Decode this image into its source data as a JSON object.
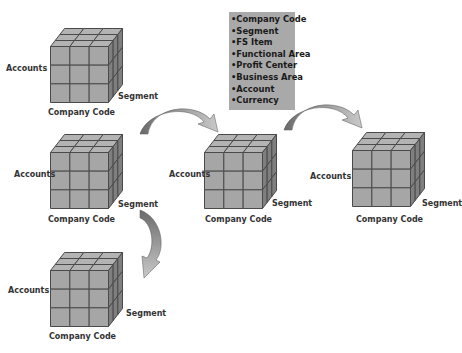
{
  "colors": {
    "face_front": "#a6a6a6",
    "face_top": "#b3b3b3",
    "face_side": "#7f7f7f",
    "edge": "#4a4a4a",
    "info_box_bg": "#a9a9a9",
    "arrow_dark": "#6b6b6b",
    "arrow_light": "#c4c4c4"
  },
  "info_box": {
    "items": [
      "•Company Code",
      "•Segment",
      "•FS Item",
      "•Functional Area",
      "•Profit Center",
      "•Business Area",
      "•Account",
      "•Currency"
    ]
  },
  "cubes": [
    {
      "id": "cube-top-left",
      "x_label": "Company Code",
      "y_label": "Accounts",
      "z_label": "Segment"
    },
    {
      "id": "cube-middle-left",
      "x_label": "Company Code",
      "y_label": "Accounts",
      "z_label": "Segment"
    },
    {
      "id": "cube-bottom-left",
      "x_label": "Company Code",
      "y_label": "Accounts",
      "z_label": "Segment"
    },
    {
      "id": "cube-center",
      "x_label": "Company Code",
      "y_label": "Accounts",
      "z_label": "Segment"
    },
    {
      "id": "cube-right",
      "x_label": "Company Code",
      "y_label": "Accounts",
      "z_label": "Segment"
    }
  ],
  "arrows": [
    {
      "id": "arrow-left-to-center",
      "direction": "right"
    },
    {
      "id": "arrow-center-to-right",
      "direction": "right"
    },
    {
      "id": "arrow-middle-to-bottom",
      "direction": "down"
    }
  ]
}
